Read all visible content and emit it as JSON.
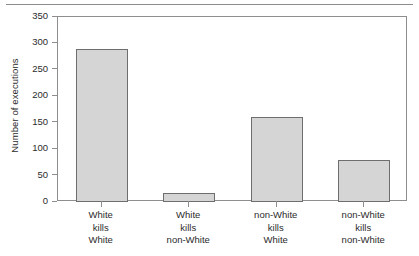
{
  "chart_data": {
    "type": "bar",
    "title": "",
    "subtitle": "",
    "xlabel": "",
    "ylabel": "Number of executions",
    "ylim": [
      0,
      350
    ],
    "yticks": [
      0,
      50,
      100,
      150,
      200,
      250,
      300,
      350
    ],
    "grid": false,
    "legend": null,
    "categories": [
      "White kills White",
      "White kills non-White",
      "non-White kills White",
      "non-White kills non-White"
    ],
    "category_lines": [
      [
        "White",
        "kills",
        "White"
      ],
      [
        "White",
        "kills",
        "non-White"
      ],
      [
        "non-White",
        "kills",
        "White"
      ],
      [
        "non-White",
        "kills",
        "non-White"
      ]
    ],
    "values": [
      289,
      17,
      161,
      79
    ],
    "bar_color": "#d5d5d5",
    "bar_edge_color": "#6e6e6e",
    "axis_color": "#8e8e8e",
    "text_color": "#2b2b2b"
  }
}
